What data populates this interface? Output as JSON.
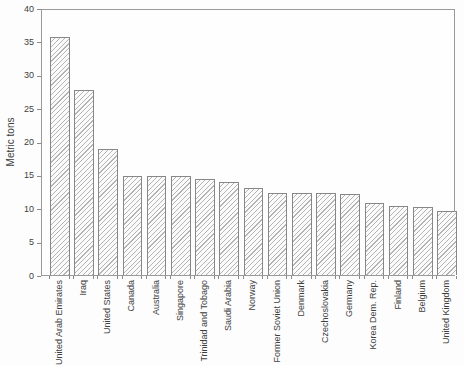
{
  "chart_data": {
    "type": "bar",
    "title": "",
    "xlabel": "",
    "ylabel": "Metric tons",
    "ylim": [
      0,
      40
    ],
    "yticks": [
      0,
      5,
      10,
      15,
      20,
      25,
      30,
      35,
      40
    ],
    "grid": false,
    "legend_position": "none",
    "categories": [
      "United Arab Emirates",
      "Iraq",
      "United States",
      "Canada",
      "Australia",
      "Singapore",
      "Trinidad and Tobago",
      "Saudi Arabia",
      "Norway",
      "Former Soviet Union",
      "Denmark",
      "Czechoslovakia",
      "Germany",
      "Korea Dem. Rep.",
      "Finland",
      "Belgium",
      "United Kingdom"
    ],
    "values": [
      36,
      28,
      19,
      15,
      15,
      14.9,
      14.5,
      14,
      13.2,
      12.4,
      12.4,
      12.4,
      12.2,
      10.9,
      10.4,
      10.3,
      9.7
    ],
    "bar_style": {
      "fill": "#fbfbfb",
      "hatch": "diagonal-forward",
      "hatch_color": "#b4b4b4",
      "border_color": "#878787"
    },
    "axis_color": "#9a9a9a",
    "text_color": "#3d3d3d"
  }
}
